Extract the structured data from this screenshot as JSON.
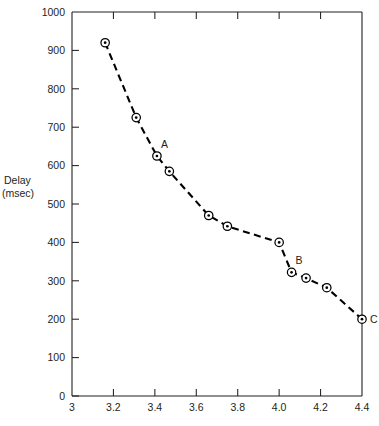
{
  "chart_data": {
    "type": "line",
    "title": "",
    "subtitle": "",
    "xlabel": "",
    "ylabel_lines": [
      "Delay",
      "(msec)"
    ],
    "ylabel": "Delay (msec)",
    "xlim": [
      3.0,
      4.4
    ],
    "ylim": [
      0,
      1000
    ],
    "grid": false,
    "legend": "none",
    "marker_style": "open-circle-with-center-dot",
    "line_style": "dashed",
    "xticks": [
      3.0,
      3.2,
      3.4,
      3.6,
      3.8,
      4.0,
      4.2,
      4.4
    ],
    "xtick_labels": [
      "3",
      "3.2",
      "3.4",
      "3.6",
      "3.8",
      "4.0",
      "4.2",
      "4.4"
    ],
    "yticks": [
      0,
      100,
      200,
      300,
      400,
      500,
      600,
      700,
      800,
      900,
      1000
    ],
    "ytick_labels": [
      "0",
      "100",
      "200",
      "300",
      "400",
      "500",
      "600",
      "700",
      "800",
      "900",
      "1000"
    ],
    "x": [
      3.16,
      3.31,
      3.41,
      3.47,
      3.66,
      3.75,
      4.0,
      4.06,
      4.13,
      4.23,
      4.4
    ],
    "values": [
      920,
      725,
      625,
      585,
      470,
      442,
      400,
      322,
      307,
      282,
      200
    ],
    "points": [
      {
        "x": 3.16,
        "y": 920,
        "label": ""
      },
      {
        "x": 3.31,
        "y": 725,
        "label": ""
      },
      {
        "x": 3.41,
        "y": 625,
        "label": "A"
      },
      {
        "x": 3.47,
        "y": 585,
        "label": ""
      },
      {
        "x": 3.66,
        "y": 470,
        "label": ""
      },
      {
        "x": 3.75,
        "y": 442,
        "label": ""
      },
      {
        "x": 4.0,
        "y": 400,
        "label": ""
      },
      {
        "x": 4.06,
        "y": 322,
        "label": "B"
      },
      {
        "x": 4.13,
        "y": 307,
        "label": ""
      },
      {
        "x": 4.23,
        "y": 282,
        "label": ""
      },
      {
        "x": 4.4,
        "y": 200,
        "label": "C"
      }
    ],
    "annotations": [
      {
        "text": "A",
        "x": 3.41,
        "y": 625,
        "placement": "above-right"
      },
      {
        "text": "B",
        "x": 4.06,
        "y": 322,
        "placement": "above-right"
      },
      {
        "text": "C",
        "x": 4.4,
        "y": 200,
        "placement": "right"
      }
    ],
    "colors": {
      "line": "#000000",
      "marker_fill": "#ffffff",
      "marker_stroke": "#000000",
      "axis": "#231f20",
      "text": "#231f20",
      "background": "#ffffff"
    }
  }
}
